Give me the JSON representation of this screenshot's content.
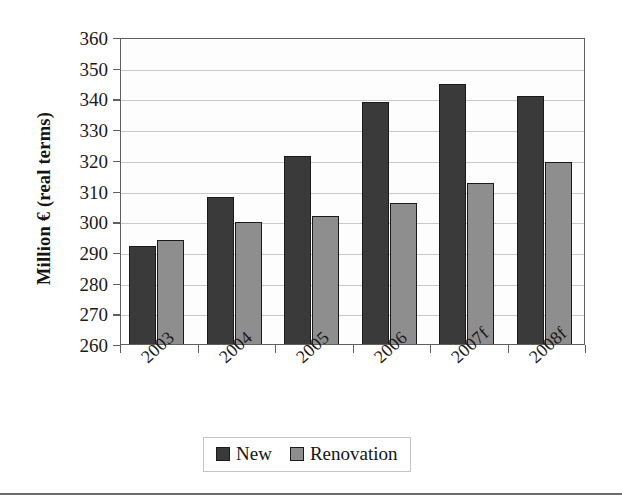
{
  "chart_data": {
    "type": "bar",
    "title": "",
    "xlabel": "",
    "ylabel": "Million € (real terms)",
    "categories": [
      "2003",
      "2004",
      "2005",
      "2006",
      "2007f",
      "2008f"
    ],
    "series": [
      {
        "name": "New",
        "color": "#3a3a3a",
        "values": [
          292.5,
          308.5,
          322.0,
          339.5,
          345.5,
          341.5
        ]
      },
      {
        "name": "Renovation",
        "color": "#8e8e8e",
        "values": [
          294.5,
          300.5,
          302.5,
          306.5,
          313.0,
          320.0
        ]
      }
    ],
    "ylim": [
      260,
      360
    ],
    "ytick_step": 10,
    "yticks": [
      360,
      350,
      340,
      330,
      320,
      310,
      300,
      290,
      280,
      270,
      260
    ],
    "grid": true,
    "legend_position": "bottom-center",
    "xtick_label_rotation": -42
  },
  "axes": {
    "y_title": "Million € (real terms)"
  },
  "legend": {
    "entries": [
      {
        "label": "New"
      },
      {
        "label": "Renovation"
      }
    ]
  }
}
